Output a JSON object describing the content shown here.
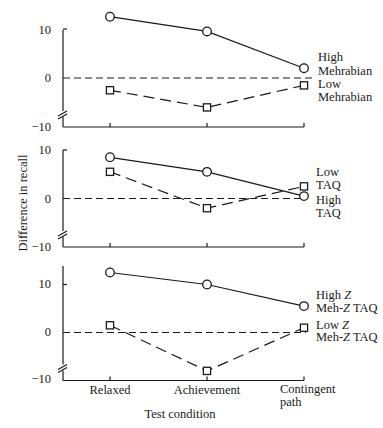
{
  "chart_data": {
    "type": "line",
    "xlabel": "Test condition",
    "ylabel": "Difference in recall",
    "categories": [
      "Relaxed",
      "Achievement",
      "Contingent path"
    ],
    "category_lines": [
      [
        "Relaxed"
      ],
      [
        "Achievement"
      ],
      [
        "Contingent",
        "path"
      ]
    ],
    "y_ticks": [
      "10",
      "0",
      "−10"
    ],
    "ylim": [
      -10,
      13
    ],
    "grid": false,
    "axis_break": true,
    "zero_reference_line": "dashed",
    "panels": [
      {
        "id": "mehrabian",
        "series": [
          {
            "name": "High Mehrabian",
            "marker": "circle",
            "line": "solid",
            "values": [
              12.5,
              9.5,
              2
            ]
          },
          {
            "name": "Low Mehrabian",
            "marker": "square",
            "line": "dashed",
            "values": [
              -2.5,
              -6,
              -1.5
            ]
          }
        ],
        "labels": {
          "high_line1": "High",
          "high_line2": "Mehrabian",
          "low_line1": "Low",
          "low_line2": "Mehrabian"
        }
      },
      {
        "id": "taq",
        "series": [
          {
            "name": "High TAQ",
            "marker": "circle",
            "line": "solid",
            "values": [
              8.5,
              5.5,
              0.5
            ]
          },
          {
            "name": "Low TAQ",
            "marker": "square",
            "line": "dashed",
            "values": [
              5.5,
              -2,
              2.5
            ]
          }
        ],
        "labels": {
          "low_line1": "Low",
          "low_line2": "TAQ",
          "high_line1": "High",
          "high_line2": "TAQ"
        }
      },
      {
        "id": "meh-z-taq",
        "series": [
          {
            "name": "High Z Meh-Z TAQ",
            "marker": "circle",
            "line": "solid",
            "values": [
              12.5,
              10,
              5.5
            ]
          },
          {
            "name": "Low Z Meh-Z TAQ",
            "marker": "square",
            "line": "dashed",
            "values": [
              1.5,
              -8,
              1
            ]
          }
        ],
        "labels": {
          "high_a": "High ",
          "high_z": "Z",
          "high_line2_a": "Meh-",
          "high_line2_z": "Z",
          "high_line2_b": " TAQ",
          "low_a": "Low ",
          "low_z": "Z",
          "low_line2_a": "Meh-",
          "low_line2_z": "Z",
          "low_line2_b": " TAQ"
        }
      }
    ]
  }
}
